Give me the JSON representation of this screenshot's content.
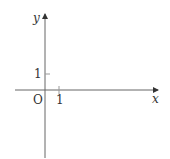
{
  "diagram": {
    "type": "coordinate-axes",
    "x_axis_label": "x",
    "y_axis_label": "y",
    "origin_label": "O",
    "x_tick_label": "1",
    "y_tick_label": "1",
    "axis_color": "#555555"
  }
}
